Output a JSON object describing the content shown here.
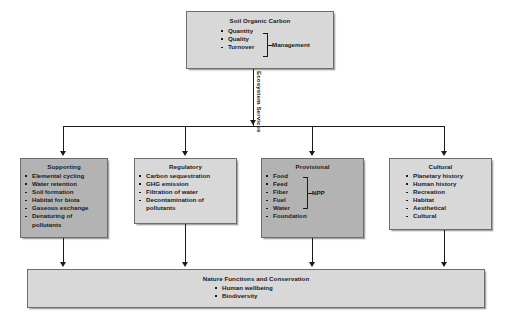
{
  "diagram": {
    "title_flow": "Soil Organic Carbon ecosystem services flow diagram",
    "top_box": {
      "title": "Soil Organic Carbon",
      "items": [
        "Quantity",
        "Quality",
        "Turnover"
      ],
      "brace_label": "Management"
    },
    "connector": {
      "ecosystem_services_label": "Ecosystem Services"
    },
    "services": [
      {
        "title": "Supporting",
        "shade": "dark",
        "items": [
          "Elemental cycling",
          "Water retention",
          "Soil formation",
          "Habitat for biota",
          "Gaseous exchange",
          "Denaturing of",
          "pollutants"
        ]
      },
      {
        "title": "Regulatory",
        "shade": "light",
        "items": [
          "Carbon sequestration",
          "GHG emission",
          "Filtration of water",
          "Decontamination of",
          "pollutants"
        ]
      },
      {
        "title": "Provisional",
        "shade": "dark",
        "brace_label": "NPP",
        "items": [
          "Food",
          "Feed",
          "Fiber",
          "Fuel",
          "Water",
          "Foundation"
        ]
      },
      {
        "title": "Cultural",
        "shade": "light",
        "items": [
          "Planetary history",
          "Human history",
          "Recreation",
          "Habitat",
          "Aesthetical",
          "Cultural"
        ]
      }
    ],
    "bottom_box": {
      "title": "Nature Functions and Conservation",
      "items": [
        "Human wellbeing",
        "Biodiversity"
      ]
    },
    "colors": {
      "box_dark": "#b3b3b3",
      "box_light": "#d8d8d8",
      "box_border": "#6d6d6d",
      "line": "#1a1a1a",
      "background": "#ffffff"
    }
  }
}
